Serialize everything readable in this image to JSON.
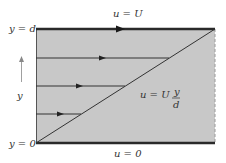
{
  "diagram": {
    "labels": {
      "top_wall": "u = U",
      "bottom_wall": "u = 0",
      "top_y": "y = d",
      "bottom_y": "y = 0",
      "y_axis": "y",
      "profile_lhs": "u = U",
      "profile_num": "y",
      "profile_den": "d"
    },
    "colors": {
      "fluid_fill": "#c8c8c8",
      "wall": "#2a2a2a",
      "line": "#333333",
      "dashed_edge": "#9a9a9a"
    },
    "velocity_arrows": [
      {
        "y_fraction": 0.75
      },
      {
        "y_fraction": 0.5
      },
      {
        "y_fraction": 0.25
      }
    ]
  }
}
